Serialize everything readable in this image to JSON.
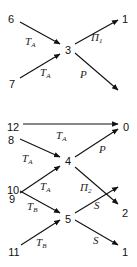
{
  "diagram": {
    "nodes": [
      {
        "id": "n6",
        "label": "6",
        "x": 11,
        "y": 19
      },
      {
        "id": "n1a",
        "label": "1",
        "x": 125,
        "y": 19
      },
      {
        "id": "n3",
        "label": "3",
        "x": 68,
        "y": 50
      },
      {
        "id": "n7",
        "label": "7",
        "x": 12,
        "y": 84
      },
      {
        "id": "n12",
        "label": "12",
        "x": 13,
        "y": 127
      },
      {
        "id": "n0",
        "label": "0",
        "x": 126,
        "y": 127
      },
      {
        "id": "n8",
        "label": "8",
        "x": 11,
        "y": 140
      },
      {
        "id": "n4",
        "label": "4",
        "x": 68,
        "y": 161
      },
      {
        "id": "n9",
        "label": "9",
        "x": 12,
        "y": 199
      },
      {
        "id": "n2",
        "label": "2",
        "x": 125,
        "y": 213
      },
      {
        "id": "n10",
        "label": "10",
        "x": 13,
        "y": 190
      },
      {
        "id": "n5",
        "label": "5",
        "x": 68,
        "y": 219
      },
      {
        "id": "n11",
        "label": "11",
        "x": 14,
        "y": 252
      },
      {
        "id": "n1b",
        "label": "1",
        "x": 125,
        "y": 252
      }
    ],
    "edges": [
      {
        "from": "6",
        "to": "3",
        "label": "T",
        "sub": "A",
        "x1": 20,
        "y1": 22,
        "x2": 60,
        "y2": 44,
        "lx": 25,
        "ly": 45
      },
      {
        "from": "7",
        "to": "3",
        "label": "T",
        "sub": "A",
        "x1": 20,
        "y1": 78,
        "x2": 60,
        "y2": 54,
        "lx": 40,
        "ly": 76
      },
      {
        "from": "3",
        "to": "1",
        "label": "Π",
        "sub": "1",
        "x1": 75,
        "y1": 44,
        "x2": 118,
        "y2": 20,
        "lx": 91,
        "ly": 41
      },
      {
        "from": "3",
        "to": "0",
        "label": "P",
        "sub": "",
        "x1": 75,
        "y1": 53,
        "x2": 118,
        "y2": 90,
        "lx": 80,
        "ly": 78
      },
      {
        "from": "12",
        "to": "0",
        "label": "T",
        "sub": "A",
        "x1": 23,
        "y1": 124,
        "x2": 118,
        "y2": 124,
        "lx": 56,
        "ly": 139
      },
      {
        "from": "8",
        "to": "4",
        "label": "T",
        "sub": "A",
        "x1": 20,
        "y1": 139,
        "x2": 60,
        "y2": 157,
        "lx": 22,
        "ly": 162
      },
      {
        "from": "4",
        "to": "0",
        "label": "P",
        "sub": "",
        "x1": 75,
        "y1": 157,
        "x2": 118,
        "y2": 129,
        "lx": 99,
        "ly": 153
      },
      {
        "from": "9",
        "to": "4",
        "label": "T",
        "sub": "A",
        "x1": 20,
        "y1": 193,
        "x2": 60,
        "y2": 166,
        "lx": 40,
        "ly": 190
      },
      {
        "from": "4",
        "to": "2",
        "label": "Π",
        "sub": "2",
        "x1": 75,
        "y1": 167,
        "x2": 118,
        "y2": 204,
        "lx": 80,
        "ly": 191
      },
      {
        "from": "10",
        "to": "5",
        "label": "T",
        "sub": "B",
        "x1": 20,
        "y1": 191,
        "x2": 60,
        "y2": 213,
        "lx": 27,
        "ly": 210
      },
      {
        "from": "11",
        "to": "5",
        "label": "T",
        "sub": "B",
        "x1": 21,
        "y1": 245,
        "x2": 60,
        "y2": 220,
        "lx": 36,
        "ly": 246
      },
      {
        "from": "5",
        "to": "2",
        "label": "S",
        "sub": "",
        "x1": 75,
        "y1": 213,
        "x2": 118,
        "y2": 187,
        "lx": 94,
        "ly": 209
      },
      {
        "from": "5",
        "to": "1",
        "label": "S",
        "sub": "",
        "x1": 75,
        "y1": 220,
        "x2": 118,
        "y2": 245,
        "lx": 93,
        "ly": 244
      }
    ]
  }
}
